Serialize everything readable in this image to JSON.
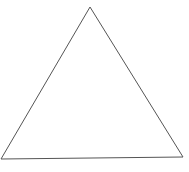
{
  "diagram": {
    "shape": "triangle",
    "vertices": [
      {
        "name": "top",
        "x": 90,
        "y": 7
      },
      {
        "name": "bottom-left",
        "x": 1,
        "y": 159
      },
      {
        "name": "bottom-right",
        "x": 183,
        "y": 157
      }
    ],
    "stroke_color": "#555555",
    "stroke_width": 1,
    "fill_color": "#ffffff",
    "background_color": "#ffffff"
  }
}
